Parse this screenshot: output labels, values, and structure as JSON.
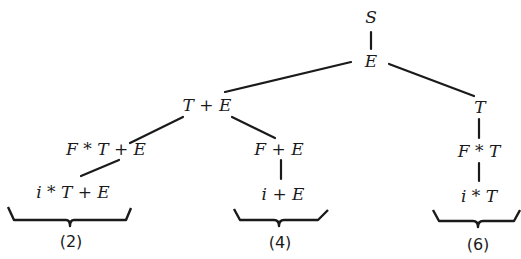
{
  "diagram": {
    "type": "derivation-tree",
    "nodes": {
      "root": "S",
      "e1": "E",
      "te": "T + E",
      "t": "T",
      "fte": "F * T + E",
      "fe": "F + E",
      "ft": "F * T",
      "ite": "i * T + E",
      "ie": "i + E",
      "it": "i * T"
    },
    "braces": {
      "b2": "(2)",
      "b4": "(4)",
      "b6": "(6)"
    },
    "edges": [
      [
        "root",
        "e1"
      ],
      [
        "e1",
        "te"
      ],
      [
        "e1",
        "t"
      ],
      [
        "te",
        "fte"
      ],
      [
        "te",
        "fe"
      ],
      [
        "t",
        "ft"
      ],
      [
        "fte",
        "ite"
      ],
      [
        "fe",
        "ie"
      ],
      [
        "ft",
        "it"
      ]
    ]
  }
}
